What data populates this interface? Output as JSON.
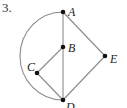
{
  "problem": {
    "number": "3."
  },
  "diagram": {
    "type": "graph",
    "nodes": [
      {
        "id": "A",
        "label": "A",
        "x": 63,
        "y": 12
      },
      {
        "id": "B",
        "label": "B",
        "x": 63,
        "y": 47
      },
      {
        "id": "C",
        "label": "C",
        "x": 37,
        "y": 73
      },
      {
        "id": "D",
        "label": "D",
        "x": 63,
        "y": 100
      },
      {
        "id": "E",
        "label": "E",
        "x": 105,
        "y": 56
      }
    ],
    "edges": [
      {
        "from": "A",
        "to": "B",
        "kind": "line"
      },
      {
        "from": "B",
        "to": "D",
        "kind": "line"
      },
      {
        "from": "B",
        "to": "C",
        "kind": "line"
      },
      {
        "from": "C",
        "to": "D",
        "kind": "line"
      },
      {
        "from": "A",
        "to": "E",
        "kind": "line"
      },
      {
        "from": "E",
        "to": "D",
        "kind": "line"
      },
      {
        "from": "A",
        "to": "D",
        "kind": "arc-left"
      }
    ],
    "colors": {
      "edge": "#8a8a8a",
      "node": "#111111"
    }
  }
}
